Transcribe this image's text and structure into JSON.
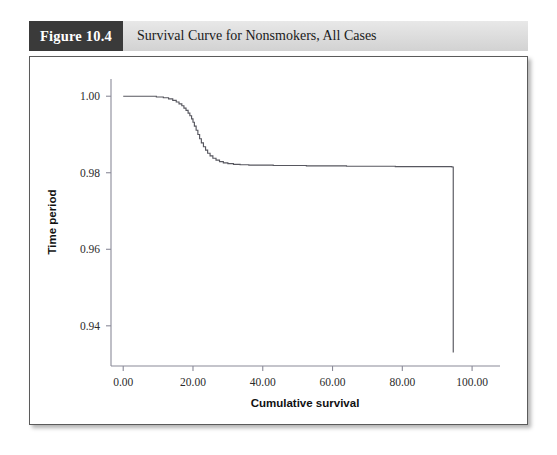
{
  "figure": {
    "number_label": "Figure 10.4",
    "caption": "Survival Curve for Nonsmokers, All Cases"
  },
  "colors": {
    "badge_background": "#3a3a3a",
    "badge_text": "#ffffff",
    "caption_bar_background": "#dcdcdc",
    "frame_border": "#5b5b5b",
    "curve_stroke": "#57575f",
    "axis_stroke": "#8a8a98",
    "page_background": "#ffffff"
  },
  "chart_data": {
    "type": "line",
    "title": "Survival Curve for Nonsmokers, All Cases",
    "subtitle": "",
    "xlabel": "Cumulative survival",
    "ylabel": "Time period",
    "xlim": [
      -3.5,
      108
    ],
    "ylim": [
      0.9295,
      1.0045
    ],
    "xticks": [
      0,
      20,
      40,
      60,
      80,
      100
    ],
    "xtick_labels": [
      "0.00",
      "20.00",
      "40.00",
      "60.00",
      "80.00",
      "100.00"
    ],
    "yticks": [
      0.94,
      0.96,
      0.98,
      1.0
    ],
    "ytick_labels": [
      "0.94",
      "0.96",
      "0.98",
      "1.00"
    ],
    "grid": false,
    "legend": null,
    "step_style": "post",
    "series": [
      {
        "name": "Survival (nonsmokers, all cases)",
        "x": [
          0.0,
          6.0,
          9.5,
          11.5,
          13.0,
          14.2,
          15.2,
          16.0,
          16.8,
          17.4,
          18.0,
          18.6,
          19.1,
          19.6,
          20.0,
          20.4,
          20.9,
          21.4,
          21.9,
          22.4,
          23.0,
          23.6,
          24.2,
          24.9,
          25.7,
          26.6,
          27.6,
          28.7,
          30.0,
          31.6,
          33.5,
          36.0,
          39.2,
          43.0,
          47.5,
          52.5,
          58.0,
          64.0,
          70.0,
          78.0,
          86.0,
          94.2,
          94.6
        ],
        "y": [
          1.0,
          1.0,
          0.9998,
          0.9996,
          0.9993,
          0.9989,
          0.9985,
          0.998,
          0.9975,
          0.9969,
          0.9963,
          0.9956,
          0.9949,
          0.9941,
          0.9932,
          0.9922,
          0.9911,
          0.99,
          0.9889,
          0.9878,
          0.9868,
          0.9859,
          0.9851,
          0.9844,
          0.9838,
          0.9833,
          0.9829,
          0.9826,
          0.9824,
          0.9822,
          0.9821,
          0.982,
          0.982,
          0.9819,
          0.9819,
          0.9818,
          0.9818,
          0.9817,
          0.9817,
          0.9816,
          0.9816,
          0.9815,
          0.933
        ]
      }
    ],
    "annotations": []
  }
}
